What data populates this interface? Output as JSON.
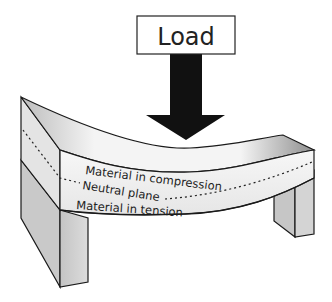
{
  "diagram": {
    "type": "beam-bending",
    "load_label": "Load",
    "labels": {
      "compression": "Material in compression",
      "neutral": "Neutral plane",
      "tension": "Material in tension"
    },
    "colors": {
      "outline": "#1a1a1a",
      "arrow": "#111111",
      "face_light": "#f2f2f2",
      "face_mid": "#d9d9d9",
      "face_dark": "#a8a8a8",
      "background": "#ffffff"
    }
  }
}
